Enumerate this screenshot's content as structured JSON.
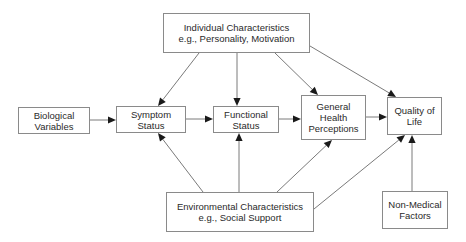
{
  "diagram": {
    "nodes": {
      "individual": {
        "lines": [
          "Individual Characteristics",
          "e.g., Personality, Motivation"
        ]
      },
      "biological": {
        "lines": [
          "Biological",
          "Variables"
        ]
      },
      "symptom": {
        "lines": [
          "Symptom",
          "Status"
        ]
      },
      "functional": {
        "lines": [
          "Functional",
          "Status"
        ]
      },
      "general_health": {
        "lines": [
          "General",
          "Health",
          "Perceptions"
        ]
      },
      "quality_of_life": {
        "lines": [
          "Quality of",
          "Life"
        ]
      },
      "environmental": {
        "lines": [
          "Environmental Characteristics",
          "e.g., Social Support"
        ]
      },
      "non_medical": {
        "lines": [
          "Non-Medical",
          "Factors"
        ]
      }
    },
    "edges": [
      {
        "from": "biological",
        "to": "symptom"
      },
      {
        "from": "symptom",
        "to": "functional"
      },
      {
        "from": "functional",
        "to": "general_health"
      },
      {
        "from": "general_health",
        "to": "quality_of_life"
      },
      {
        "from": "individual",
        "to": "symptom"
      },
      {
        "from": "individual",
        "to": "functional"
      },
      {
        "from": "individual",
        "to": "general_health"
      },
      {
        "from": "individual",
        "to": "quality_of_life"
      },
      {
        "from": "environmental",
        "to": "symptom"
      },
      {
        "from": "environmental",
        "to": "functional"
      },
      {
        "from": "environmental",
        "to": "general_health"
      },
      {
        "from": "environmental",
        "to": "quality_of_life"
      },
      {
        "from": "non_medical",
        "to": "quality_of_life"
      }
    ],
    "colors": {
      "line": "#7a7a7a",
      "arrowhead": "#1a1a1a",
      "border": "#8a8a8a",
      "text": "#2a2a2a"
    }
  }
}
